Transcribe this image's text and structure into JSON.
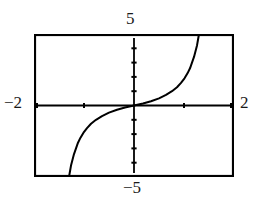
{
  "chart_data": {
    "type": "line",
    "title": "",
    "xlabel": "",
    "ylabel": "",
    "xlim": [
      -2,
      2
    ],
    "ylim": [
      -5,
      5
    ],
    "grid": false,
    "legend": null,
    "axis_labels": {
      "top": "5",
      "bottom": "−5",
      "left": "−2",
      "right": "2"
    },
    "x_tick_values": [
      -1,
      0,
      1
    ],
    "y_tick_values": [
      -4,
      -3,
      -2,
      -1,
      0,
      1,
      2,
      3,
      4
    ],
    "series": [
      {
        "name": "curve",
        "color": "#000000",
        "x": [
          -1.3,
          -1.28,
          -1.26,
          -1.23,
          -1.2,
          -1.16,
          -1.12,
          -1.07,
          -1.01,
          -0.94,
          -0.86,
          -0.76,
          -0.64,
          -0.5,
          -0.34,
          -0.18,
          0.0,
          0.18,
          0.34,
          0.5,
          0.64,
          0.76,
          0.86,
          0.94,
          1.01,
          1.07,
          1.12,
          1.16,
          1.2,
          1.23,
          1.26,
          1.28,
          1.3
        ],
        "y": [
          -5.0,
          -4.6,
          -4.2,
          -3.8,
          -3.4,
          -3.0,
          -2.6,
          -2.25,
          -1.9,
          -1.58,
          -1.28,
          -1.0,
          -0.74,
          -0.5,
          -0.3,
          -0.14,
          0.0,
          0.14,
          0.3,
          0.5,
          0.74,
          1.0,
          1.28,
          1.58,
          1.9,
          2.25,
          2.6,
          3.0,
          3.4,
          3.8,
          4.2,
          4.6,
          5.0
        ]
      }
    ]
  },
  "frame": {
    "border_color": "#000000",
    "background": "#ffffff"
  }
}
